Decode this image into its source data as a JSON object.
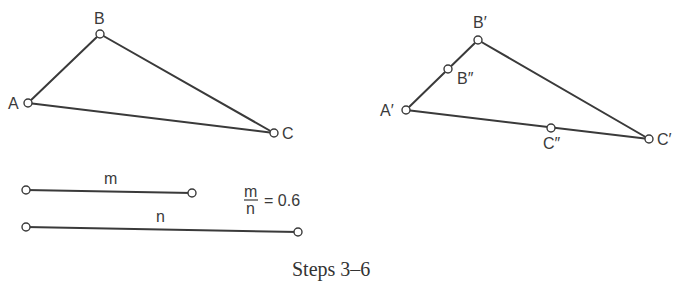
{
  "caption": "Steps 3–6",
  "triangle_original": {
    "vertices": [
      {
        "label": "A",
        "x": 28,
        "y": 103
      },
      {
        "label": "B",
        "x": 100,
        "y": 34
      },
      {
        "label": "C",
        "x": 274,
        "y": 133
      }
    ]
  },
  "triangle_image": {
    "vertices": [
      {
        "label": "A′",
        "x": 406,
        "y": 110
      },
      {
        "label": "B′",
        "x": 478,
        "y": 40
      },
      {
        "label": "C′",
        "x": 649,
        "y": 139
      }
    ],
    "division_points": [
      {
        "label": "B″",
        "x": 448,
        "y": 69
      },
      {
        "label": "C″",
        "x": 551,
        "y": 128
      }
    ]
  },
  "segments": [
    {
      "label": "m",
      "x1": 26,
      "y1": 190,
      "x2": 192,
      "y2": 193
    },
    {
      "label": "n",
      "x1": 26,
      "y1": 227,
      "x2": 298,
      "y2": 232
    }
  ],
  "ratio": {
    "numerator": "m",
    "denominator": "n",
    "equals": "= 0.6",
    "value": 0.6
  }
}
